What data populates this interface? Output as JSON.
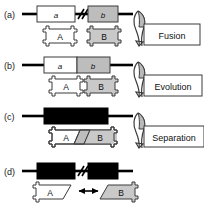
{
  "figure": {
    "title": "",
    "panels": [
      {
        "id": "a",
        "label": "(a)",
        "genes": [
          {
            "name": "a",
            "fill": "white"
          },
          {
            "name": "b",
            "fill": "gray"
          }
        ],
        "break_symbol": "//",
        "separated_genes": true,
        "proteins": [
          {
            "name": "A",
            "fill": "white"
          },
          {
            "name": "B",
            "fill": "gray"
          }
        ],
        "proteins_touching": false,
        "process_label": "Fusion"
      },
      {
        "id": "b",
        "label": "(b)",
        "genes": [
          {
            "name": "a",
            "fill": "white"
          },
          {
            "name": "b",
            "fill": "gray"
          }
        ],
        "break_symbol": "",
        "separated_genes": false,
        "proteins": [
          {
            "name": "A",
            "fill": "white"
          },
          {
            "name": "B",
            "fill": "gray"
          }
        ],
        "proteins_touching": true,
        "process_label": "Evolution"
      },
      {
        "id": "c",
        "label": "(c)",
        "genes": [
          {
            "name": "",
            "fill": "black"
          }
        ],
        "break_symbol": "",
        "separated_genes": false,
        "proteins": [
          {
            "name": "A",
            "fill": "white"
          },
          {
            "name": "B",
            "fill": "gray"
          }
        ],
        "proteins_fused": true,
        "process_label": "Separation"
      },
      {
        "id": "d",
        "label": "(d)",
        "genes": [
          {
            "name": "",
            "fill": "black"
          },
          {
            "name": "",
            "fill": "black"
          }
        ],
        "break_symbol": "//",
        "separated_genes": true,
        "proteins": [
          {
            "name": "A",
            "fill": "white"
          },
          {
            "name": "B",
            "fill": "gray"
          }
        ],
        "interaction_arrow": true,
        "process_label": ""
      }
    ],
    "colors": {
      "line": "#000000",
      "gene_gray": "#bdbdbd",
      "gene_white": "#ffffff",
      "gene_black": "#000000",
      "protein_gray": "#c9c9c9",
      "protein_white": "#ffffff",
      "outline": "#3a3a3a",
      "text": "#111111"
    }
  }
}
